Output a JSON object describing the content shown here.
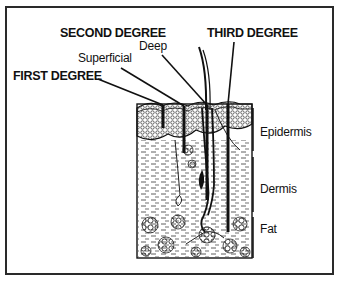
{
  "diagram": {
    "burn_labels": {
      "first_degree": "FIRST DEGREE",
      "second_degree": "SECOND DEGREE",
      "second_superficial": "Superficial",
      "second_deep": "Deep",
      "third_degree": "THIRD DEGREE"
    },
    "layer_labels": {
      "epidermis": "Epidermis",
      "dermis": "Dermis",
      "fat": "Fat"
    },
    "colors": {
      "ink": "#111111",
      "background": "#ffffff",
      "frame": "#2a2a2a"
    }
  }
}
